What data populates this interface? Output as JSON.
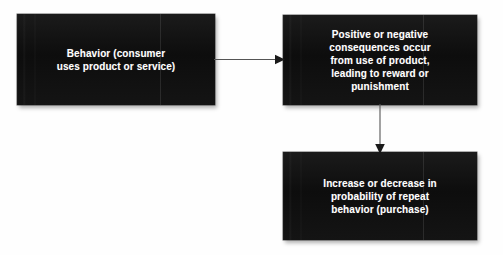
{
  "diagram": {
    "title": "",
    "background_color": "#fefefe",
    "node_fill_color": "#131313",
    "node_text_color": "#ffffff",
    "connector_color": "#555555",
    "nodes": [
      {
        "id": "behavior",
        "label": "Behavior (consumer\nuses product or service)",
        "lines": [
          "Behavior (consumer",
          "uses product or service)"
        ]
      },
      {
        "id": "consequences",
        "label": "Positive or negative\nconsequences occur\nfrom use of product,\nleading to reward or\npunishment",
        "lines": [
          "Positive or negative",
          "consequences occur",
          "from use of product,",
          "leading to reward or",
          "punishment"
        ]
      },
      {
        "id": "probability",
        "label": "Increase or decrease in\nprobability of repeat\nbehavior (purchase)",
        "lines": [
          "Increase or decrease in",
          "probability of repeat",
          "behavior (purchase)"
        ]
      }
    ],
    "connectors": [
      {
        "id": "behavior-to-consequences",
        "from": "behavior",
        "to": "consequences",
        "direction": "right",
        "icon": "arrow-right-icon"
      },
      {
        "id": "consequences-to-probability",
        "from": "consequences",
        "to": "probability",
        "direction": "down",
        "icon": "arrow-down-icon"
      }
    ]
  }
}
